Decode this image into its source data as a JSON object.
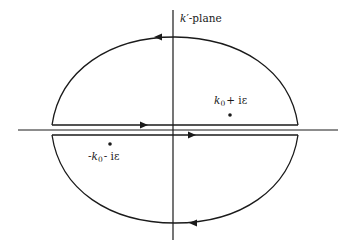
{
  "diagram": {
    "plane_label": {
      "var": "k",
      "prime": "′",
      "suffix": "-plane"
    },
    "pole_upper": {
      "k": "k",
      "sub": "0",
      "rest": "+ iε"
    },
    "pole_lower": {
      "prefix": "-",
      "k": "k",
      "sub": "0",
      "rest": "- iε"
    },
    "colors": {
      "stroke": "#1a1a1a",
      "background": "#ffffff"
    },
    "elements": [
      "horizontal real axis",
      "vertical imaginary axis",
      "upper half-plane closed contour (counterclockwise)",
      "lower half-plane closed contour (clockwise)",
      "pole at k0 + i epsilon",
      "pole at -k0 - i epsilon"
    ]
  }
}
